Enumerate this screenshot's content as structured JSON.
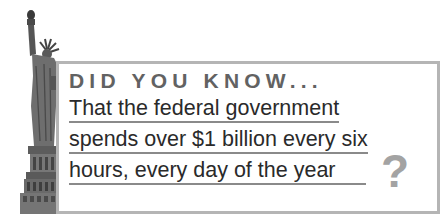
{
  "graphic": {
    "image": "statue-of-liberty-icon",
    "heading": "DID YOU KNOW...",
    "fact_lines": [
      "That the federal government",
      "spends over $1 billion every six",
      "hours, every day of the year"
    ],
    "end_mark": "?",
    "colors": {
      "heading": "#626262",
      "body_text": "#2a2a2a",
      "border": "#b5b5b5",
      "underline": "#8a8a8a",
      "question_mark": "#a3a3a3"
    }
  }
}
